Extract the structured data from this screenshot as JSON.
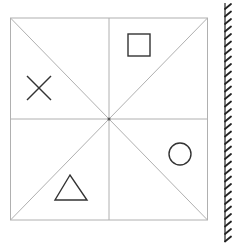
{
  "diagram": {
    "grid": {
      "x0": 10.5,
      "y0": 18,
      "x1": 207.5,
      "y1": 220,
      "center": [
        109,
        119
      ],
      "line_color": "#b0b0b0",
      "center_dot_color": "#555555"
    },
    "shapes": [
      {
        "kind": "square",
        "label": "square-symbol",
        "x": 128,
        "y": 34,
        "size": 22,
        "region": "top-right-upper"
      },
      {
        "kind": "cross",
        "label": "x-symbol",
        "x0": 27,
        "y0": 76,
        "x1": 51,
        "y1": 100,
        "region": "top-left-lower"
      },
      {
        "kind": "circle",
        "label": "circle-symbol",
        "cx": 180,
        "cy": 154,
        "r": 11,
        "region": "bottom-right-upper"
      },
      {
        "kind": "triangle",
        "label": "triangle-symbol",
        "points": [
          [
            70,
            175
          ],
          [
            55,
            200
          ],
          [
            87,
            200
          ]
        ],
        "region": "bottom-left-lower"
      }
    ],
    "shape_color": "#333333",
    "mirror": {
      "x": 225,
      "y0": 3,
      "y1": 242,
      "hatch_spacing": 7.5,
      "hatch_dx": 6,
      "hatch_dy": -5,
      "color": "#222222"
    }
  }
}
